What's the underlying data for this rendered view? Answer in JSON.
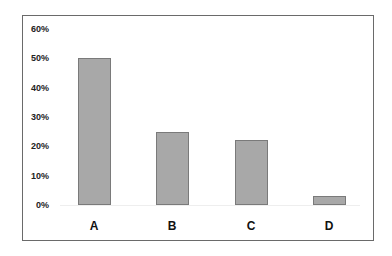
{
  "chart_data": {
    "type": "bar",
    "title": "",
    "xlabel": "",
    "ylabel": "",
    "categories": [
      "A",
      "B",
      "C",
      "D"
    ],
    "values": [
      50,
      25,
      22,
      3
    ],
    "value_unit": "%",
    "ylim": [
      0,
      60
    ],
    "yticks": [
      "0%",
      "10%",
      "20%",
      "30%",
      "40%",
      "50%",
      "60%"
    ],
    "grid": false,
    "legend": null,
    "bar_color": "#a8a8a8",
    "bar_border_color": "#7a7a7a"
  }
}
